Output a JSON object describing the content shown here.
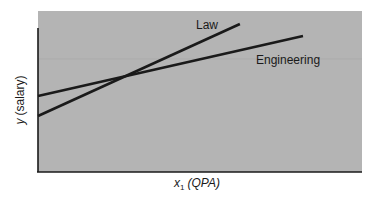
{
  "chart_data": {
    "type": "line",
    "title": "",
    "xlabel": "x1 (QPA)",
    "ylabel": "y (salary)",
    "xlabel_parts": {
      "var": "x",
      "sub": "1",
      "rest": "(QPA)"
    },
    "ylabel_parts": {
      "var": "y",
      "rest": "(salary)"
    },
    "xlim": [
      0,
      100
    ],
    "ylim": [
      0,
      100
    ],
    "ticks": "none",
    "grid": false,
    "legend": "inline labels",
    "background": "#b4b4b4",
    "series": [
      {
        "name": "Law",
        "color": "#1a1a1a",
        "x": [
          0,
          62.3
        ],
        "y": [
          34.8,
          91.9
        ]
      },
      {
        "name": "Engineering",
        "color": "#1a1a1a",
        "x": [
          0,
          81.8
        ],
        "y": [
          47.2,
          84.5
        ]
      }
    ],
    "annotations": [
      {
        "text": "Law",
        "attached_to": "Law",
        "position": "above line end"
      },
      {
        "text": "Engineering",
        "attached_to": "Engineering",
        "position": "below line end"
      }
    ],
    "intersection": {
      "x": 25.9,
      "y": 59.0
    }
  },
  "labels": {
    "law": "Law",
    "engineering": "Engineering",
    "x_var": "x",
    "x_sub": "1",
    "x_rest": "(QPA)",
    "y_var": "y",
    "y_rest": "(salary)"
  }
}
